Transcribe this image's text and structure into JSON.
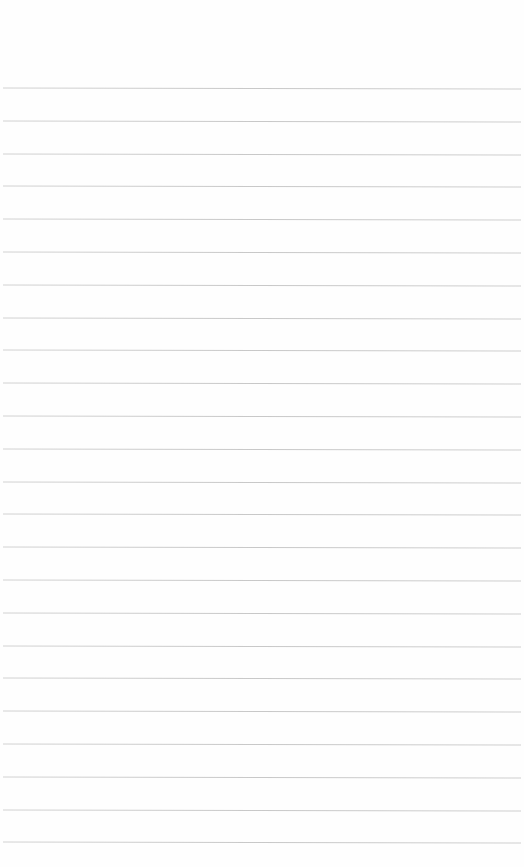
{
  "page": {
    "type": "blank lined paper",
    "background_color": "#fefefe",
    "line_color": "#cccccc",
    "line_count": 24,
    "first_line_y": 88,
    "line_spacing": 32.8
  }
}
